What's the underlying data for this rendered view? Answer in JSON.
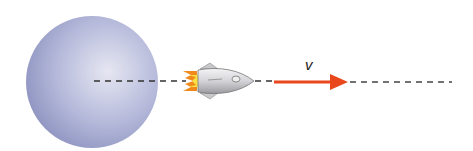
{
  "diagram": {
    "planet": {
      "name": "planet",
      "color": "#a7acd2",
      "highlight": "#e4e5f1"
    },
    "rocket": {
      "name": "rocket",
      "body_color": "#d9d9dc",
      "flame_color": "#f7b21c"
    },
    "velocity": {
      "label": "v",
      "arrow_color": "#e8481c"
    },
    "trajectory": {
      "style": "dashed",
      "color": "#333333"
    }
  }
}
